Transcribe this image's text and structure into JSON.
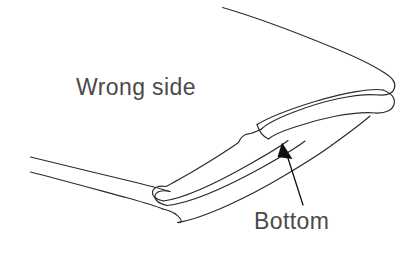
{
  "figure": {
    "kind": "sewing-fold-illustration",
    "background_color": "#ffffff",
    "line_color": "#2b2b2b",
    "label_color": "#4a4a4a",
    "arrow_color": "#111111",
    "labels": {
      "wrong_side": "Wrong side",
      "bottom": "Bottom"
    },
    "annotations": [
      {
        "name": "wrong-side",
        "text": "Wrong side",
        "x": 76,
        "y": 74,
        "has_leader": false
      },
      {
        "name": "bottom",
        "text": "Bottom",
        "x": 254,
        "y": 208,
        "has_leader": true,
        "leader_from": [
          303,
          205
        ],
        "leader_to": [
          285,
          148
        ],
        "arrow_head": "solid-triangle"
      }
    ]
  }
}
